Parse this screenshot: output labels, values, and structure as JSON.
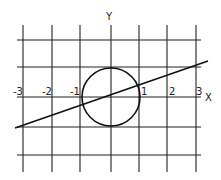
{
  "axes": {
    "x_label": "X",
    "y_label": "Y"
  },
  "x_ticks": [
    {
      "label": "-3",
      "x": 23
    },
    {
      "label": "-2",
      "x": 52
    },
    {
      "label": "-1",
      "x": 80
    },
    {
      "label": "1",
      "x": 139
    },
    {
      "label": "2",
      "x": 167
    },
    {
      "label": "3",
      "x": 196
    }
  ],
  "grid": {
    "vertical": [
      23,
      52,
      80,
      111,
      139,
      167,
      196
    ],
    "horizontal": [
      40,
      67,
      97,
      127,
      155
    ]
  },
  "circle": {
    "center": "(0,0)",
    "radius": 1
  },
  "line": {
    "description": "line through origin with slope ~1/3"
  },
  "colors": {
    "ink": "#111111",
    "grid": "#222222"
  }
}
